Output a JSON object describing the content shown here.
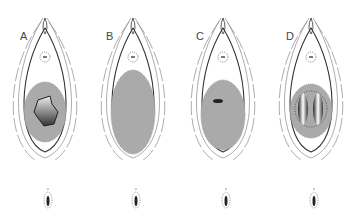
{
  "figure": {
    "panels": [
      {
        "label": "A",
        "x": 0,
        "center_x": 45,
        "inner": "irregular-dark-mass"
      },
      {
        "label": "B",
        "x": 88,
        "center_x": 133,
        "inner": "large-gray-oval"
      },
      {
        "label": "C",
        "x": 178,
        "center_x": 223,
        "inner": "small-dark-spot"
      },
      {
        "label": "D",
        "x": 266,
        "center_x": 311,
        "inner": "two-dark-lobes"
      }
    ],
    "colors": {
      "outline": "#333333",
      "faint_outline": "#888888",
      "gray_fill": "#aaaaaa",
      "dark_fill": "#222222"
    }
  }
}
